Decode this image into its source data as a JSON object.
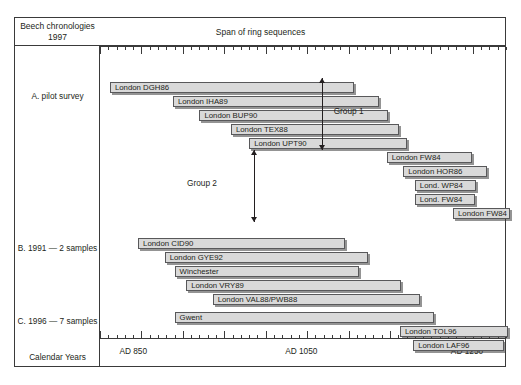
{
  "header": {
    "corner_title_line1": "Beech chronologies",
    "corner_title_line2": "1997",
    "span_title": "Span of ring sequences"
  },
  "axis": {
    "calendar_years_label": "Calendar Years",
    "tick_labels": [
      "AD 850",
      "AD 1050",
      "AD 1250"
    ]
  },
  "sections": [
    {
      "label": "A. pilot survey"
    },
    {
      "label": "B. 1991 — 2 samples"
    },
    {
      "label": "C. 1996 — 7 samples"
    }
  ],
  "groups": [
    {
      "label": "Group 1"
    },
    {
      "label": "Group 2"
    }
  ],
  "chart_data": {
    "type": "bar",
    "title": "Beech chronologies 1997",
    "subtitle": "Span of ring sequences",
    "xlabel": "Calendar Years",
    "ylabel": "",
    "orientation": "horizontal-range",
    "xlim": [
      800,
      1290
    ],
    "xticks": [
      850,
      1050,
      1250
    ],
    "xtick_labels": [
      "AD 850",
      "AD 1050",
      "AD 1250"
    ],
    "major_tick_interval": 50,
    "minor_tick_interval": 10,
    "grid": false,
    "legend": "none",
    "annotations": [
      {
        "text": "Group 1",
        "type": "double-arrow-bracket"
      },
      {
        "text": "Group 2",
        "type": "double-arrow-bracket"
      }
    ],
    "series": [
      {
        "name": "A. pilot survey",
        "bars": [
          {
            "label": "London DGH86",
            "start": 812,
            "end": 1107
          },
          {
            "label": "London IHA89",
            "start": 888,
            "end": 1137
          },
          {
            "label": "London BUP90",
            "start": 920,
            "end": 1147
          },
          {
            "label": "London TEX88",
            "start": 958,
            "end": 1161
          },
          {
            "label": "London UPT90",
            "start": 980,
            "end": 1170
          },
          {
            "label": "London FW84",
            "start": 1146,
            "end": 1249
          },
          {
            "label": "London HOR86",
            "start": 1166,
            "end": 1267
          },
          {
            "label": "Lond. WP84",
            "start": 1180,
            "end": 1254
          },
          {
            "label": "Lond. FW84",
            "start": 1180,
            "end": 1252
          },
          {
            "label": "London FW84",
            "start": 1226,
            "end": 1295
          }
        ]
      },
      {
        "name": "B. 1991 — 2 samples",
        "bars": [
          {
            "label": "London CID90",
            "start": 846,
            "end": 1096
          },
          {
            "label": "London GYE92",
            "start": 878,
            "end": 1123
          },
          {
            "label": "Winchester",
            "start": 890,
            "end": 1112
          },
          {
            "label": "London VRY89",
            "start": 904,
            "end": 1163
          },
          {
            "label": "London VAL88/PWB88",
            "start": 936,
            "end": 1186
          }
        ]
      },
      {
        "name": "C. 1996 — 7 samples",
        "bars": [
          {
            "label": "Gwent",
            "start": 890,
            "end": 1203
          },
          {
            "label": "London TOL96",
            "start": 1162,
            "end": 1292
          },
          {
            "label": "London LAF96",
            "start": 1178,
            "end": 1288
          }
        ]
      }
    ]
  }
}
